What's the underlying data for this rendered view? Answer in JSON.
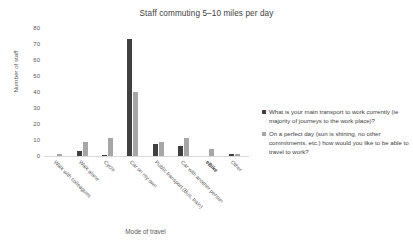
{
  "chart_data": {
    "type": "bar",
    "title": "Staff commuting 5–10 miles per day",
    "xlabel": "Mode of travel",
    "ylabel": "Number of staff",
    "ylim": [
      0,
      80
    ],
    "yticks": [
      80,
      70,
      60,
      50,
      40,
      30,
      20,
      10,
      0
    ],
    "grid": false,
    "legend_position": "right",
    "categories": [
      "Walk with colleagues",
      "Walk alone",
      "Cycle",
      "Car on my own",
      "Public transport (Bus, train)",
      "Car with another person",
      "eBike",
      "Other"
    ],
    "series": [
      {
        "name": "What is your main transport to work currently (ie majority of journeys to the work place)?",
        "color": "#404040",
        "values": [
          0,
          3,
          0.5,
          73,
          7.5,
          6.5,
          0,
          1
        ]
      },
      {
        "name": "On a perfect day (sun is shining, no other commitments, etc.) how would you like to be able to travel to work?",
        "color": "#a6a6a6",
        "values": [
          1,
          9,
          11.5,
          40,
          8.5,
          11.5,
          4.5,
          1
        ]
      }
    ]
  },
  "legend": {
    "items": [
      "What is your main transport to work currently (ie majority of journeys to the work place)?",
      "On a perfect day (sun is shining, no other commitments, etc.) how would you like to be able to travel to work?"
    ]
  },
  "axis": {
    "x_title": "Mode of travel",
    "y_title": "Number of staff"
  }
}
